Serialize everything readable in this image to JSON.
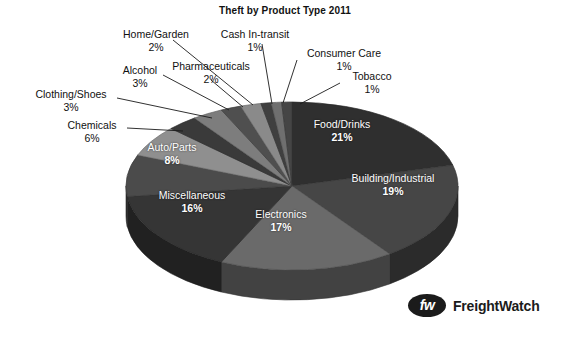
{
  "chart_data": {
    "type": "pie",
    "title": "Theft by Product Type 2011",
    "xlabel": "",
    "ylabel": "",
    "legend_position": "none",
    "grid": false,
    "categories": [
      "Food/Drinks",
      "Building/Industrial",
      "Electronics",
      "Miscellaneous",
      "Auto/Parts",
      "Chemicals",
      "Clothing/Shoes",
      "Alcohol",
      "Pharmaceuticals",
      "Home/Garden",
      "Cash In-transit",
      "Consumer Care",
      "Tobacco"
    ],
    "values": [
      21,
      19,
      17,
      16,
      8,
      6,
      3,
      3,
      2,
      2,
      1,
      1,
      1
    ],
    "value_labels": [
      "21%",
      "19%",
      "17%",
      "16%",
      "8%",
      "6%",
      "3%",
      "3%",
      "2%",
      "2%",
      "1%",
      "1%",
      "1%"
    ],
    "units": "percent",
    "slices": [
      {
        "name": "Food/Drinks",
        "value": 21,
        "label": "21%",
        "color": "#2f2f2f",
        "label_placement": "inside"
      },
      {
        "name": "Building/Industrial",
        "value": 19,
        "label": "19%",
        "color": "#464646",
        "label_placement": "inside"
      },
      {
        "name": "Electronics",
        "value": 17,
        "label": "17%",
        "color": "#6a6a6a",
        "label_placement": "inside"
      },
      {
        "name": "Miscellaneous",
        "value": 16,
        "label": "16%",
        "color": "#353535",
        "label_placement": "inside"
      },
      {
        "name": "Auto/Parts",
        "value": 8,
        "label": "8%",
        "color": "#4b4b4b",
        "label_placement": "inside"
      },
      {
        "name": "Chemicals",
        "value": 6,
        "label": "6%",
        "color": "#8f8f8f",
        "label_placement": "outside"
      },
      {
        "name": "Clothing/Shoes",
        "value": 3,
        "label": "3%",
        "color": "#3a3a3a",
        "label_placement": "outside"
      },
      {
        "name": "Alcohol",
        "value": 3,
        "label": "3%",
        "color": "#7d7d7d",
        "label_placement": "outside"
      },
      {
        "name": "Pharmaceuticals",
        "value": 2,
        "label": "2%",
        "color": "#4f4f4f",
        "label_placement": "outside"
      },
      {
        "name": "Home/Garden",
        "value": 2,
        "label": "2%",
        "color": "#8a8a8a",
        "label_placement": "outside"
      },
      {
        "name": "Cash In-transit",
        "value": 1,
        "label": "1%",
        "color": "#3f3f3f",
        "label_placement": "outside"
      },
      {
        "name": "Consumer Care",
        "value": 1,
        "label": "1%",
        "color": "#6f6f6f",
        "label_placement": "outside"
      },
      {
        "name": "Tobacco",
        "value": 1,
        "label": "1%",
        "color": "#454545",
        "label_placement": "outside"
      }
    ]
  },
  "labels": {
    "home_garden": {
      "name": "Home/Garden",
      "pct": "2%"
    },
    "cash_in_transit": {
      "name": "Cash In-transit",
      "pct": "1%"
    },
    "consumer_care": {
      "name": "Consumer Care",
      "pct": "1%"
    },
    "tobacco": {
      "name": "Tobacco",
      "pct": "1%"
    },
    "pharmaceuticals": {
      "name": "Pharmaceuticals",
      "pct": "2%"
    },
    "alcohol": {
      "name": "Alcohol",
      "pct": "3%"
    },
    "clothing_shoes": {
      "name": "Clothing/Shoes",
      "pct": "3%"
    },
    "chemicals": {
      "name": "Chemicals",
      "pct": "6%"
    },
    "food_drinks": {
      "name": "Food/Drinks",
      "pct": "21%"
    },
    "building": {
      "name": "Building/Industrial",
      "pct": "19%"
    },
    "electronics": {
      "name": "Electronics",
      "pct": "17%"
    },
    "miscellaneous": {
      "name": "Miscellaneous",
      "pct": "16%"
    },
    "auto_parts": {
      "name": "Auto/Parts",
      "pct": "8%"
    }
  },
  "branding": {
    "mark_text": "fw",
    "word": "FreightWatch"
  }
}
